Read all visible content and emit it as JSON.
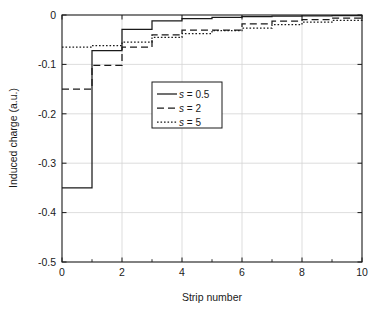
{
  "chart_data": {
    "type": "line",
    "subtype": "step",
    "title": "",
    "xlabel": "Strip number",
    "ylabel": "Induced charge (a.u.)",
    "xlim": [
      0,
      10
    ],
    "ylim": [
      -0.5,
      0
    ],
    "xticks": [
      0,
      2,
      4,
      6,
      8,
      10
    ],
    "xtick_labels": [
      "0",
      "2",
      "4",
      "6",
      "8",
      "10"
    ],
    "xminorticks": [
      1,
      3,
      5,
      7,
      9
    ],
    "yticks": [
      0,
      -0.1,
      -0.2,
      -0.3,
      -0.4,
      -0.5
    ],
    "ytick_labels": [
      "0",
      "-0.1",
      "-0.2",
      "-0.3",
      "-0.4",
      "-0.5"
    ],
    "grid": true,
    "legend_position": "upper-center",
    "x": [
      0,
      1,
      2,
      3,
      4,
      5,
      6,
      7,
      8,
      9,
      10
    ],
    "series": [
      {
        "name": "s = 0.5",
        "label_prefix": "s",
        "label_value": "= 0.5",
        "style": "solid",
        "color": "#1a1a1a",
        "values": [
          -0.35,
          -0.072,
          -0.029,
          -0.012,
          -0.0075,
          -0.005,
          -0.0035,
          -0.0025,
          -0.0018,
          -0.0012,
          -0.0008
        ]
      },
      {
        "name": "s = 2",
        "label_prefix": "s",
        "label_value": "= 2",
        "style": "dashed",
        "color": "#1a1a1a",
        "values": [
          -0.15,
          -0.102,
          -0.065,
          -0.04,
          -0.0305,
          -0.0305,
          -0.018,
          -0.0125,
          -0.0095,
          -0.0065,
          -0.005
        ]
      },
      {
        "name": "s = 5",
        "label_prefix": "s",
        "label_value": "= 5",
        "style": "dotted",
        "color": "#1a1a1a",
        "values": [
          -0.065,
          -0.062,
          -0.055,
          -0.0455,
          -0.0375,
          -0.0315,
          -0.0265,
          -0.0195,
          -0.0145,
          -0.011,
          -0.009
        ]
      }
    ]
  },
  "axes": {
    "xlabel": "Strip number",
    "ylabel": "Induced charge (a.u.)"
  },
  "legend": {
    "items": [
      {
        "label": "s = 0.5",
        "style": "solid"
      },
      {
        "label": "s = 2",
        "style": "dashed"
      },
      {
        "label": "s = 5",
        "style": "dotted"
      }
    ]
  },
  "colors": {
    "axis": "#1a1a1a",
    "grid": "#d4d4d4",
    "background": "#ffffff",
    "series": "#1a1a1a"
  }
}
